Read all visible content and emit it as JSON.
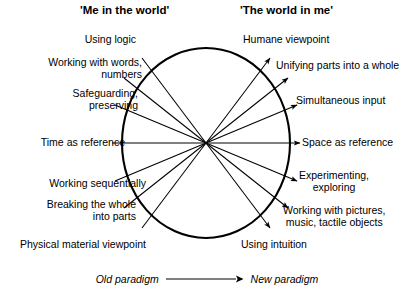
{
  "headers": {
    "left": "'Me in the world'",
    "right": "'The world in me'"
  },
  "diagram": {
    "type": "radial-spoke-wheel",
    "center": {
      "x": 206,
      "y": 143
    },
    "radius_x": 84,
    "radius_y": 95,
    "spoke_count": 7,
    "arrow_direction": "left-to-right",
    "stroke_color": "#000000",
    "background": "#ffffff",
    "spokes": [
      {
        "angle_deg": -64,
        "old": "Using logic",
        "new": "Humane viewpoint"
      },
      {
        "angle_deg": -43,
        "old": "Working with words, numbers",
        "new": "Unifying parts into a whole"
      },
      {
        "angle_deg": -21,
        "old": "Safeguarding, preserving",
        "new": "Simultaneous input"
      },
      {
        "angle_deg": 0,
        "old": "Time as reference",
        "new": "Space as reference"
      },
      {
        "angle_deg": 21,
        "old": "Working sequentially",
        "new": "Experimenting, exploring"
      },
      {
        "angle_deg": 43,
        "old": "Breaking the whole into parts",
        "new": "Working with pictures, music, tactile objects"
      },
      {
        "angle_deg": 64,
        "old": "Physical material viewpoint",
        "new": "Using intuition"
      }
    ]
  },
  "left_labels": [
    {
      "line1": "Using logic",
      "line2": ""
    },
    {
      "line1": "Working with words,",
      "line2": "numbers"
    },
    {
      "line1": "Safeguarding,",
      "line2": "preserving"
    },
    {
      "line1": "Time as reference",
      "line2": ""
    },
    {
      "line1": "Working sequentially",
      "line2": ""
    },
    {
      "line1": "Breaking the whole",
      "line2": "into parts"
    },
    {
      "line1": "Physical material viewpoint",
      "line2": ""
    }
  ],
  "right_labels": [
    {
      "line1": "Humane viewpoint",
      "line2": ""
    },
    {
      "line1": "Unifying parts into a whole",
      "line2": ""
    },
    {
      "line1": "Simultaneous input",
      "line2": ""
    },
    {
      "line1": "Space as reference",
      "line2": ""
    },
    {
      "line1": "Experimenting,",
      "line2": "exploring"
    },
    {
      "line1": "Working with pictures,",
      "line2": "music, tactile objects"
    },
    {
      "line1": "Using intuition",
      "line2": ""
    }
  ],
  "legend": {
    "old": "Old paradigm",
    "new": "New  paradigm",
    "arrow_icon": "arrow-right-icon"
  }
}
